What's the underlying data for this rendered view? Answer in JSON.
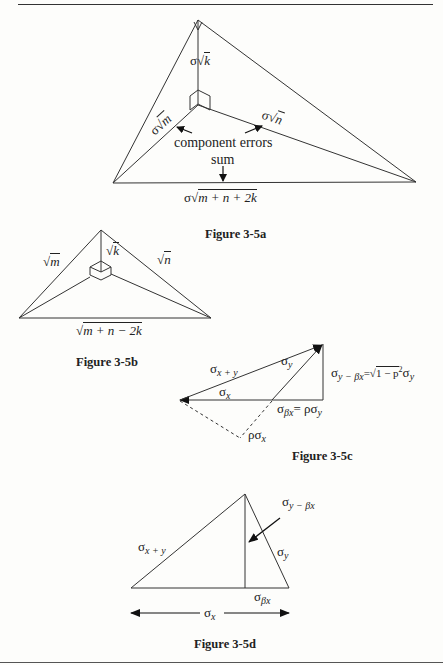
{
  "page": {
    "figures": [
      {
        "id": "fig-3-5a",
        "caption": "Figure 3-5a",
        "labels": {
          "vertical": {
            "prefix": "σ√",
            "radicand": "k"
          },
          "left_leg": {
            "prefix": "σ√",
            "radicand": "m"
          },
          "right_leg": {
            "prefix": "σ√",
            "radicand": "n"
          },
          "annotation_components": "component errors",
          "annotation_sum": "sum",
          "base": {
            "prefix": "σ√",
            "radicand": "m + n + 2k"
          }
        }
      },
      {
        "id": "fig-3-5b",
        "caption": "Figure 3-5b",
        "labels": {
          "vertical": {
            "prefix": "√",
            "radicand": "k"
          },
          "left": {
            "prefix": "√",
            "radicand": "m"
          },
          "right": {
            "prefix": "√",
            "radicand": "n"
          },
          "base": {
            "prefix": "√",
            "radicand": "m + n − 2k"
          }
        }
      },
      {
        "id": "fig-3-5c",
        "caption": "Figure 3-5c",
        "labels": {
          "hypotenuse": {
            "sym": "σ",
            "sub": "x + y"
          },
          "sigma_y": {
            "sym": "σ",
            "sub": "y"
          },
          "sigma_x": {
            "sym": "σ",
            "sub": "x"
          },
          "vertical_lhs": {
            "sym": "σ",
            "sub": "y − βx"
          },
          "vertical_eq": "=",
          "vertical_rhs_sqrt": "1 − p",
          "vertical_rhs_exp": "2",
          "vertical_rhs_tail": {
            "sym": "σ",
            "sub": "y"
          },
          "beta_lhs": {
            "sym": "σ",
            "sub": "βx"
          },
          "beta_eq": "= ρσ",
          "beta_sub": "y",
          "dashed": {
            "sym": "ρσ",
            "sub": "x"
          }
        }
      },
      {
        "id": "fig-3-5d",
        "caption": "Figure 3-5d",
        "labels": {
          "hypotenuse": {
            "sym": "σ",
            "sub": "x + y"
          },
          "pointer": {
            "sym": "σ",
            "sub": "y − βx"
          },
          "sigma_y": {
            "sym": "σ",
            "sub": "y"
          },
          "beta": {
            "sym": "σ",
            "sub": "βx"
          },
          "span": {
            "sym": "σ",
            "sub": "x"
          }
        }
      }
    ]
  }
}
